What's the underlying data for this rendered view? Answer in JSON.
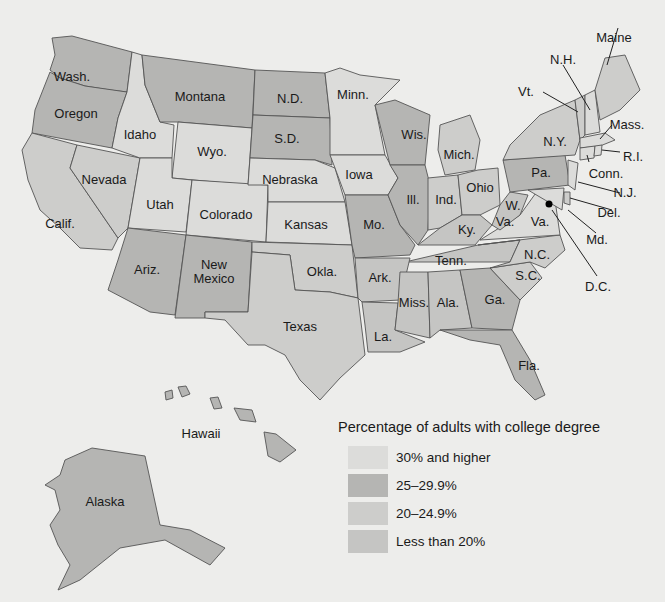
{
  "legend": {
    "title": "Percentage of adults with college degree",
    "items": [
      {
        "label": "30% and higher",
        "color": "#dcdcda"
      },
      {
        "label": "25–29.9%",
        "color": "#b5b5b3"
      },
      {
        "label": "20–24.9%",
        "color": "#cdcdcb"
      },
      {
        "label": "Less than 20%",
        "color": "#c5c5c3"
      }
    ]
  },
  "states": {
    "wash": "Wash.",
    "oregon": "Oregon",
    "idaho": "Idaho",
    "montana": "Montana",
    "nd": "N.D.",
    "sd": "S.D.",
    "minn": "Minn.",
    "wyo": "Wyo.",
    "nevada": "Nevada",
    "calif": "Calif.",
    "utah": "Utah",
    "colorado": "Colorado",
    "nebraska": "Nebraska",
    "kansas": "Kansas",
    "iowa": "Iowa",
    "wis": "Wis.",
    "mich": "Mich.",
    "ill": "Ill.",
    "ind": "Ind.",
    "ohio": "Ohio",
    "mo": "Mo.",
    "ky": "Ky.",
    "ariz": "Ariz.",
    "newmexico": "New\nMexico",
    "okla": "Okla.",
    "texas": "Texas",
    "ark": "Ark.",
    "la": "La.",
    "miss": "Miss.",
    "ala": "Ala.",
    "tenn": "Tenn.",
    "ga": "Ga.",
    "fla": "Fla.",
    "sc": "S.C.",
    "nc": "N.C.",
    "va": "Va.",
    "wva_w": "W.",
    "wva_va": "Va.",
    "pa": "Pa.",
    "ny": "N.Y.",
    "maine": "Maine",
    "nh": "N.H.",
    "vt": "Vt.",
    "mass": "Mass.",
    "ri": "R.I.",
    "conn": "Conn.",
    "nj": "N.J.",
    "del": "Del.",
    "md": "Md.",
    "dc": "D.C.",
    "hawaii": "Hawaii",
    "alaska": "Alaska"
  }
}
